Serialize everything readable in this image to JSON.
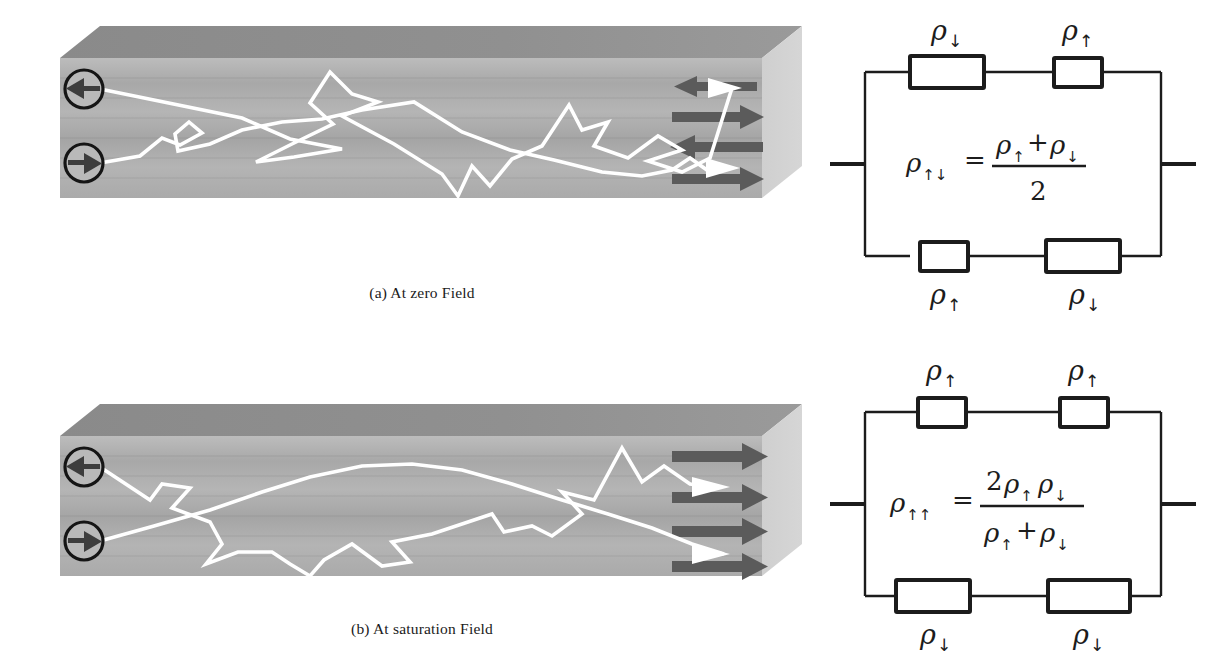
{
  "figure": {
    "title_present": false,
    "panels": [
      {
        "id": "a",
        "caption": "(a) At zero Field",
        "slab": {
          "description": "multilayer slab with antiparallel magnetization",
          "spin_markers": [
            {
              "name": "spin-down-electron",
              "direction": "left",
              "glyph": "←"
            },
            {
              "name": "spin-up-electron",
              "direction": "right",
              "glyph": "→"
            }
          ],
          "magnetization_arrows": [
            "left",
            "right",
            "left",
            "right"
          ],
          "magnetization_state": "antiparallel",
          "electron_paths": 2
        },
        "circuit": {
          "top_branch": [
            {
              "label": "ρ",
              "sub": "↓",
              "size": "large"
            },
            {
              "label": "ρ",
              "sub": "↑",
              "size": "small"
            }
          ],
          "bottom_branch": [
            {
              "label": "ρ",
              "sub": "↑",
              "size": "small"
            },
            {
              "label": "ρ",
              "sub": "↓",
              "size": "large"
            }
          ],
          "formula": {
            "lhs": "ρ",
            "lhs_sub": "↑↓",
            "equals": "=",
            "numerator": "ρ",
            "numerator_sub_1": "↑",
            "numerator_op": "+",
            "numerator_2": "ρ",
            "numerator_sub_2": "↓",
            "denominator": "2"
          }
        }
      },
      {
        "id": "b",
        "caption": "(b) At saturation Field",
        "slab": {
          "description": "multilayer slab with parallel magnetization",
          "spin_markers": [
            {
              "name": "spin-down-electron",
              "direction": "left",
              "glyph": "←"
            },
            {
              "name": "spin-up-electron",
              "direction": "right",
              "glyph": "→"
            }
          ],
          "magnetization_arrows": [
            "right",
            "right",
            "right",
            "right"
          ],
          "magnetization_state": "parallel",
          "electron_paths": 2
        },
        "circuit": {
          "top_branch": [
            {
              "label": "ρ",
              "sub": "↑",
              "size": "small"
            },
            {
              "label": "ρ",
              "sub": "↑",
              "size": "small"
            }
          ],
          "bottom_branch": [
            {
              "label": "ρ",
              "sub": "↓",
              "size": "large"
            },
            {
              "label": "ρ",
              "sub": "↓",
              "size": "large"
            }
          ],
          "formula": {
            "lhs": "ρ",
            "lhs_sub": "↑↑",
            "equals": "=",
            "numerator_coeff": "2",
            "numerator": "ρ",
            "numerator_sub_1": "↑",
            "numerator_2": "ρ",
            "numerator_sub_2": "↓",
            "denominator": "ρ",
            "denominator_sub_1": "↑",
            "denominator_op": "+",
            "denominator_2": "ρ",
            "denominator_sub_2": "↓"
          }
        }
      }
    ]
  },
  "colors": {
    "slab_top_face": "#8c8c8c",
    "slab_front_face": "#b0b0b0",
    "slab_right_face": "#c9c9c9",
    "magnetization_arrow": "#5b5b5b",
    "electron_path": "#ffffff",
    "ink": "#1c1c1c",
    "background": "#ffffff"
  }
}
